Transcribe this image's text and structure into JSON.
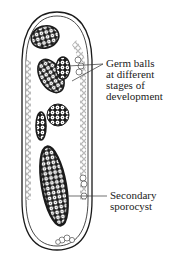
{
  "diagram": {
    "colors": {
      "line": "#1a1a1a",
      "background": "#ffffff",
      "cell_fill": "#ffffff"
    },
    "labels": {
      "germ_balls": {
        "lines": [
          "Germ balls",
          "at different",
          "stages of",
          "development"
        ]
      },
      "secondary_sporocyst": {
        "lines": [
          "Secondary",
          "sporocyst"
        ]
      }
    }
  }
}
